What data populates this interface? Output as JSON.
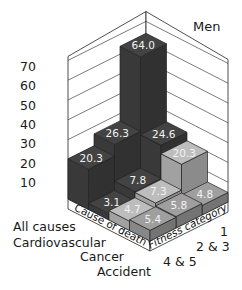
{
  "chart_data": {
    "type": "bar",
    "subtype": "3d-bar",
    "title": "Men",
    "xlabel": "Cause of death",
    "ylabel": "Fitness category",
    "causes": [
      "All causes",
      "Cardiovascular",
      "Cancer",
      "Accident"
    ],
    "fitness_categories": [
      "1",
      "2 & 3",
      "4 & 5"
    ],
    "series": [
      {
        "name": "All causes",
        "values": [
          64.0,
          26.3,
          20.3
        ],
        "color": "#3c3c3c"
      },
      {
        "name": "Cardiovascular",
        "values": [
          24.6,
          7.8,
          3.1
        ],
        "color": "#3c3c3c"
      },
      {
        "name": "Cancer",
        "values": [
          20.3,
          7.3,
          4.7
        ],
        "color": "#a9a9a9"
      },
      {
        "name": "Accident",
        "values": [
          4.8,
          5.8,
          5.4
        ],
        "color": "#8e8e8e"
      }
    ],
    "value_labels": {
      "All causes": [
        "64.0",
        "26.3",
        "20.3"
      ],
      "Cardiovascular": [
        "24.6",
        "7.8",
        "3.1"
      ],
      "Cancer": [
        "20.3",
        "7.3",
        "4.7"
      ],
      "Accident": [
        "4.8",
        "5.8",
        "5.4"
      ]
    },
    "z_ticks": [
      "10",
      "20",
      "30",
      "40",
      "50",
      "60",
      "70"
    ],
    "zlim": [
      0,
      70
    ],
    "grid": true
  },
  "labels": {
    "title": "Men",
    "cause_axis": "Cause of death",
    "fitness_axis": "Fitness category",
    "cause_0": "All causes",
    "cause_1": "Cardiovascular",
    "cause_2": "Cancer",
    "cause_3": "Accident",
    "fit_0": "1",
    "fit_1": "2 & 3",
    "fit_2": "4 & 5"
  }
}
